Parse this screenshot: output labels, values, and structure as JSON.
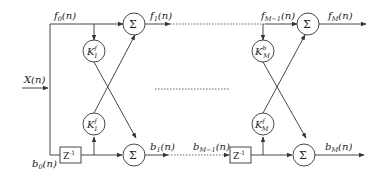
{
  "diagram": {
    "type": "lattice-filter",
    "input": {
      "label": "X(n)"
    },
    "signals": {
      "f0": "f0(n)",
      "f1": "f1(n)",
      "fM1": "fM-1(n)",
      "fM": "fM(n)",
      "b0": "b0(n)",
      "b1": "b1(n)",
      "bM1": "bM-1(n)",
      "bM": "bM(n)"
    },
    "stages": [
      {
        "name": "stage-1",
        "upper_gain": {
          "base": "K",
          "sup": "f",
          "sub": "1"
        },
        "lower_gain": {
          "base": "K",
          "sup": "f",
          "sub": "1"
        },
        "delay": "Z",
        "delay_exp": "-1",
        "sum_symbol": "Σ"
      },
      {
        "name": "stage-M",
        "upper_gain": {
          "base": "K",
          "sup": "b",
          "sub": "M"
        },
        "lower_gain": {
          "base": "K",
          "sup": "f",
          "sub": "M"
        },
        "delay": "Z",
        "delay_exp": "-1",
        "sum_symbol": "Σ"
      }
    ],
    "ellipsis": "……"
  }
}
